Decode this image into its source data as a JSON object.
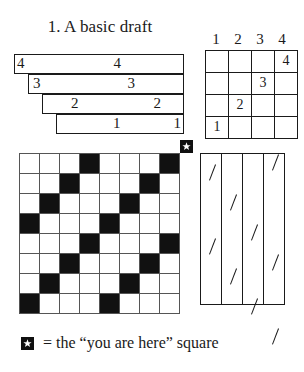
{
  "figure": {
    "title": "1. A basic draft"
  },
  "staircase": {
    "name": "nested-row-diagram",
    "rows": [
      {
        "label_left": "4",
        "label_right": "4"
      },
      {
        "label_left": "3",
        "label_right": "3"
      },
      {
        "label_left": "2",
        "label_right": "2"
      },
      {
        "label_left": "1",
        "label_right": "1"
      }
    ]
  },
  "key_grid": {
    "column_headers": [
      "1",
      "2",
      "3",
      "4"
    ],
    "cells": [
      [
        "",
        "",
        "",
        "4"
      ],
      [
        "",
        "",
        "3",
        ""
      ],
      [
        "",
        "2",
        "",
        ""
      ],
      [
        "1",
        "",
        "",
        ""
      ]
    ]
  },
  "marker": {
    "icon": "star-icon"
  },
  "checkerboard": {
    "rows": 8,
    "cols": 8,
    "pattern": [
      [
        0,
        0,
        0,
        1,
        0,
        0,
        0,
        1
      ],
      [
        0,
        0,
        1,
        0,
        0,
        0,
        1,
        0
      ],
      [
        0,
        1,
        0,
        0,
        0,
        1,
        0,
        0
      ],
      [
        1,
        0,
        0,
        0,
        1,
        0,
        0,
        0
      ],
      [
        0,
        0,
        0,
        1,
        0,
        0,
        0,
        1
      ],
      [
        0,
        0,
        1,
        0,
        0,
        0,
        1,
        0
      ],
      [
        0,
        1,
        0,
        0,
        0,
        1,
        0,
        0
      ],
      [
        1,
        0,
        0,
        0,
        1,
        0,
        0,
        0
      ]
    ],
    "colors": {
      "filled": "#111111",
      "empty": "#ffffff",
      "gridline": "#555555"
    }
  },
  "slash_panel": {
    "columns": 4,
    "slash_positions": [
      [
        10,
        84
      ],
      [
        40,
        114
      ],
      [
        70,
        144
      ],
      [
        0,
        100,
        174
      ]
    ]
  },
  "legend": {
    "text": "= the “you are here” square"
  }
}
